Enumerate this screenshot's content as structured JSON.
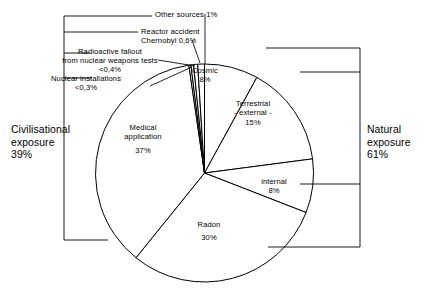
{
  "figure": {
    "title": "",
    "decimal_separator": ",",
    "background": "#ffffff",
    "stroke": "#000000"
  },
  "chart_data": {
    "type": "pie",
    "title": "",
    "xlabel": "",
    "ylabel": "",
    "units": "percent",
    "start_angle_deg": 0,
    "direction": "clockwise",
    "categories": [
      "Cosmic",
      "Terrestrial - external -",
      "internal",
      "Radon",
      "Medical application",
      "Nuclear installations",
      "Radioactive fallout from nuclear weapons tests",
      "Reactor accident Chernobyl",
      "Other sources"
    ],
    "values": [
      8,
      15,
      8,
      30,
      37,
      0.3,
      0.4,
      0.6,
      1
    ],
    "value_labels": [
      "8%",
      "15%",
      "8%",
      "30%",
      "37%",
      "<0,3%",
      "<0,4%",
      "0,6%",
      "1%"
    ],
    "groups": [
      {
        "name": "Natural exposure",
        "value": 61,
        "value_label": "61%",
        "members": [
          "Cosmic",
          "Terrestrial - external -",
          "internal",
          "Radon"
        ]
      },
      {
        "name": "Civilisational exposure",
        "value": 39,
        "value_label": "39%",
        "members": [
          "Medical application",
          "Nuclear installations",
          "Radioactive fallout from nuclear weapons tests",
          "Reactor accident Chernobyl",
          "Other sources"
        ]
      }
    ],
    "legend": "none",
    "grid": false
  },
  "slices": {
    "cosmic": {
      "name": "Cosmic",
      "value_label": "8%"
    },
    "terrestrial": {
      "line1": "Terrestrial",
      "line2": "- external -",
      "value_label": "15%"
    },
    "internal": {
      "name": "internal",
      "value_label": "8%"
    },
    "radon": {
      "name": "Radon",
      "value_label": "30%"
    },
    "medical": {
      "line1": "Medical",
      "line2": "application",
      "value_label": "37%"
    }
  },
  "callouts": {
    "other_sources": {
      "text": "Other sources 1%"
    },
    "chernobyl": {
      "line1": "Reactor accident",
      "line2": "Chernobyl 0,6%"
    },
    "fallout": {
      "line1": "Radioactive fallout",
      "line2": "from nuclear weapons tests",
      "line3": "<0,4%"
    },
    "nuclear_installations": {
      "line1": "Nuclear installations",
      "line2": "<0,3%"
    }
  },
  "brackets": {
    "left": {
      "line1": "Civilisational",
      "line2": "exposure",
      "line3": "39%"
    },
    "right": {
      "line1": "Natural",
      "line2": "exposure",
      "line3": "61%"
    }
  }
}
